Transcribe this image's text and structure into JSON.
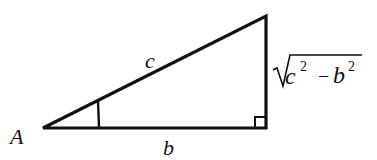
{
  "diagram": {
    "type": "right-triangle",
    "vertex_label": "A",
    "hypotenuse_label": "c",
    "adjacent_label": "b",
    "opposite_label": {
      "radicand_base1": "c",
      "exp1": "2",
      "minus": "−",
      "radicand_base2": "b",
      "exp2": "2",
      "full": "√(c² − b²)"
    },
    "angle_marker": "angle at A",
    "right_angle_marker": "right angle at bottom-right vertex",
    "stroke_color": "#111111",
    "background": "#ffffff"
  }
}
